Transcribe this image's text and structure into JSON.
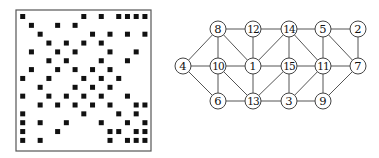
{
  "matrix": {
    "size": 15,
    "frame": {
      "x": 16,
      "y": 10,
      "width": 135,
      "height": 141
    },
    "origin": {
      "x": 22.7,
      "y": 16.5
    },
    "cell_spacing": {
      "x": 8.73,
      "y": 8.85
    },
    "square_size": 5,
    "rows": [
      [
        1,
        8,
        10,
        12,
        13,
        14,
        15
      ],
      [
        2,
        5,
        7
      ],
      [
        3,
        9,
        11,
        13,
        15
      ],
      [
        4,
        6,
        8,
        10
      ],
      [
        2,
        5,
        7,
        11,
        14
      ],
      [
        4,
        6,
        10,
        13
      ],
      [
        2,
        5,
        7,
        9,
        11
      ],
      [
        1,
        4,
        8,
        10,
        12
      ],
      [
        3,
        7,
        9,
        11
      ],
      [
        1,
        4,
        6,
        8,
        10,
        13
      ],
      [
        3,
        5,
        7,
        9,
        11,
        14,
        15
      ],
      [
        1,
        8,
        12,
        14
      ],
      [
        1,
        3,
        6,
        10,
        13,
        15
      ],
      [
        1,
        5,
        11,
        12,
        14,
        15
      ],
      [
        1,
        3,
        11,
        13,
        14,
        15
      ]
    ]
  },
  "graph": {
    "node_radius": 8,
    "nodes": [
      {
        "id": "8",
        "label": "8",
        "x": 218,
        "y": 29
      },
      {
        "id": "12",
        "label": "12",
        "x": 253,
        "y": 29
      },
      {
        "id": "14",
        "label": "14",
        "x": 289,
        "y": 29
      },
      {
        "id": "5",
        "label": "5",
        "x": 323,
        "y": 29
      },
      {
        "id": "2",
        "label": "2",
        "x": 358,
        "y": 29
      },
      {
        "id": "4",
        "label": "4",
        "x": 183,
        "y": 66
      },
      {
        "id": "10",
        "label": "10",
        "x": 218,
        "y": 66
      },
      {
        "id": "1",
        "label": "1",
        "x": 253,
        "y": 66
      },
      {
        "id": "15",
        "label": "15",
        "x": 289,
        "y": 66
      },
      {
        "id": "11",
        "label": "11",
        "x": 323,
        "y": 66
      },
      {
        "id": "7",
        "label": "7",
        "x": 358,
        "y": 66
      },
      {
        "id": "6",
        "label": "6",
        "x": 218,
        "y": 101
      },
      {
        "id": "13",
        "label": "13",
        "x": 253,
        "y": 101
      },
      {
        "id": "3",
        "label": "3",
        "x": 289,
        "y": 101
      },
      {
        "id": "9",
        "label": "9",
        "x": 323,
        "y": 101
      }
    ],
    "edges": [
      [
        "8",
        "12"
      ],
      [
        "12",
        "14"
      ],
      [
        "14",
        "5"
      ],
      [
        "5",
        "2"
      ],
      [
        "4",
        "10"
      ],
      [
        "10",
        "1"
      ],
      [
        "1",
        "15"
      ],
      [
        "15",
        "11"
      ],
      [
        "11",
        "7"
      ],
      [
        "6",
        "13"
      ],
      [
        "13",
        "3"
      ],
      [
        "3",
        "9"
      ],
      [
        "8",
        "4"
      ],
      [
        "4",
        "6"
      ],
      [
        "8",
        "10"
      ],
      [
        "10",
        "6"
      ],
      [
        "8",
        "1"
      ],
      [
        "10",
        "13"
      ],
      [
        "12",
        "1"
      ],
      [
        "1",
        "13"
      ],
      [
        "1",
        "14"
      ],
      [
        "13",
        "15"
      ],
      [
        "14",
        "15"
      ],
      [
        "15",
        "3"
      ],
      [
        "14",
        "11"
      ],
      [
        "3",
        "11"
      ],
      [
        "5",
        "11"
      ],
      [
        "11",
        "9"
      ],
      [
        "5",
        "7"
      ],
      [
        "2",
        "7"
      ],
      [
        "7",
        "9"
      ]
    ]
  },
  "colors": {
    "square": "#111111",
    "frame": "#555555",
    "edge": "#555555",
    "node_stroke": "#444444",
    "node_fill": "#ffffff",
    "label": "#111111"
  }
}
